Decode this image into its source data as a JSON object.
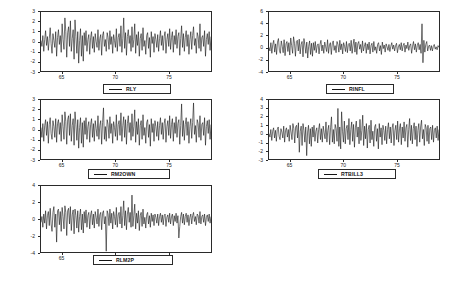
{
  "figure": {
    "width": 460,
    "height": 281,
    "background": "#ffffff",
    "line_color": "#141414",
    "axis_color": "#2a2a2a"
  },
  "chart_data": [
    {
      "type": "line",
      "title": "",
      "xlabel": "",
      "ylabel": "",
      "legend": "RLY",
      "legend_position": "below-center",
      "grid": false,
      "xlim": [
        63.0,
        79.0
      ],
      "ylim": [
        -3,
        3
      ],
      "xticks": [
        65,
        70,
        75
      ],
      "xtick_labels": [
        "65",
        "70",
        "75"
      ],
      "yticks": [
        3,
        2,
        1,
        0,
        -1,
        -2,
        -3
      ],
      "ytick_labels": [
        "3",
        "2",
        "1",
        "0",
        "-1",
        "-2",
        "-3"
      ],
      "values": [
        0.1,
        -0.5,
        0.6,
        -1.0,
        0.2,
        1.1,
        -0.4,
        0.5,
        -0.9,
        0.3,
        1.4,
        -0.2,
        -1.2,
        0.8,
        0.1,
        -0.6,
        1.0,
        -1.5,
        0.4,
        1.2,
        -0.3,
        0.6,
        -1.1,
        1.8,
        0.2,
        -0.8,
        2.4,
        1.0,
        -1.6,
        0.9,
        1.5,
        -0.5,
        2.1,
        -1.0,
        0.3,
        1.2,
        -1.8,
        2.2,
        0.5,
        -1.2,
        1.0,
        -2.2,
        0.1,
        1.3,
        -1.5,
        0.6,
        -2.0,
        0.9,
        -0.4,
        1.1,
        -1.0,
        0.2,
        0.7,
        -1.3,
        0.4,
        1.0,
        -0.7,
        0.5,
        -1.1,
        0.8,
        0.0,
        -0.6,
        1.2,
        -0.9,
        0.3,
        0.7,
        -1.4,
        0.6,
        1.0,
        -0.5,
        0.2,
        -1.0,
        0.9,
        0.4,
        -0.8,
        1.1,
        -0.3,
        0.5,
        -1.2,
        0.7,
        0.1,
        -0.6,
        1.3,
        -1.0,
        0.4,
        0.8,
        -0.5,
        1.6,
        -1.1,
        0.3,
        2.4,
        -0.7,
        0.9,
        -1.4,
        0.5,
        1.2,
        -0.2,
        0.6,
        -1.0,
        1.5,
        -0.6,
        0.2,
        1.8,
        -1.2,
        0.7,
        -0.4,
        1.0,
        -1.5,
        0.3,
        0.8,
        -0.9,
        1.4,
        -0.5,
        0.1,
        -1.3,
        0.6,
        0.9,
        -0.7,
        0.4,
        -1.6,
        1.0,
        -0.2,
        0.5,
        -1.1,
        0.8,
        0.2,
        -0.6,
        0.7,
        -1.0,
        0.3,
        1.1,
        -0.4,
        0.6,
        -0.9,
        0.5,
        1.0,
        -1.2,
        0.2,
        0.8,
        -0.5,
        1.3,
        -0.8,
        0.4,
        1.0,
        -1.1,
        0.6,
        -0.3,
        1.2,
        -0.7,
        0.5,
        0.9,
        -1.4,
        0.3,
        1.6,
        -0.6,
        0.8,
        -1.0,
        0.4,
        1.1,
        -0.5,
        0.7,
        -1.3,
        0.2,
        1.0,
        -0.8,
        0.6,
        1.5,
        -0.4,
        0.3,
        -1.2,
        0.9,
        0.5,
        -0.7,
        1.8,
        -1.0,
        0.4,
        0.6,
        -0.5,
        1.1,
        -1.5,
        0.2,
        0.8,
        -0.3,
        1.0,
        -0.9,
        0.5
      ]
    },
    {
      "type": "line",
      "title": "",
      "xlabel": "",
      "ylabel": "",
      "legend": "RINFL",
      "legend_position": "below-center",
      "grid": false,
      "xlim": [
        63.0,
        79.0
      ],
      "ylim": [
        -4,
        6
      ],
      "xticks": [
        65,
        70,
        75
      ],
      "xtick_labels": [
        "65",
        "70",
        "75"
      ],
      "yticks": [
        6,
        4,
        2,
        0,
        -2,
        -4
      ],
      "ytick_labels": [
        "6",
        "4",
        "2",
        "0",
        "-2",
        "-4"
      ],
      "values": [
        0.0,
        -0.6,
        0.8,
        -1.0,
        0.5,
        1.2,
        -0.8,
        0.6,
        -1.2,
        0.9,
        1.5,
        -0.5,
        -1.0,
        1.1,
        0.2,
        -0.9,
        1.3,
        -1.4,
        0.6,
        1.0,
        -0.7,
        0.8,
        -1.3,
        1.6,
        0.3,
        -1.0,
        1.8,
        0.7,
        -1.5,
        1.0,
        1.2,
        -0.6,
        1.4,
        -1.1,
        0.5,
        1.0,
        -1.6,
        1.5,
        0.4,
        -1.0,
        0.9,
        -1.8,
        0.2,
        1.1,
        -1.2,
        0.7,
        -1.5,
        0.8,
        -0.5,
        1.0,
        -0.9,
        0.3,
        0.6,
        -1.1,
        0.5,
        1.2,
        -0.6,
        0.4,
        -1.0,
        0.9,
        0.1,
        -0.7,
        1.3,
        -1.0,
        0.4,
        0.8,
        -1.2,
        0.6,
        1.1,
        -0.5,
        0.3,
        -0.9,
        1.0,
        0.5,
        -0.8,
        1.2,
        -0.4,
        0.6,
        -1.1,
        0.8,
        0.2,
        -0.7,
        1.0,
        -0.9,
        0.5,
        0.7,
        -0.6,
        1.2,
        -1.0,
        0.4,
        1.4,
        -0.8,
        0.9,
        -1.2,
        0.6,
        1.0,
        -0.3,
        0.5,
        -0.9,
        1.1,
        -0.6,
        0.2,
        0.8,
        -1.0,
        0.6,
        -0.4,
        0.9,
        -1.1,
        0.3,
        0.7,
        -0.8,
        1.0,
        -0.5,
        0.1,
        -1.0,
        0.5,
        0.8,
        -0.6,
        0.3,
        -1.2,
        0.9,
        -0.2,
        0.4,
        -0.8,
        0.6,
        0.1,
        -0.5,
        0.5,
        -0.7,
        0.2,
        0.8,
        -0.3,
        0.4,
        -0.6,
        0.3,
        0.7,
        -0.9,
        0.1,
        0.5,
        -0.4,
        0.8,
        -0.6,
        0.3,
        0.7,
        -0.8,
        0.4,
        -0.2,
        0.9,
        -0.5,
        0.3,
        0.6,
        -1.0,
        0.2,
        1.0,
        -0.4,
        0.6,
        -0.8,
        0.3,
        0.8,
        -0.4,
        0.5,
        -1.0,
        4.0,
        -2.6,
        1.2,
        -0.8,
        0.5,
        1.0,
        -0.6,
        0.2,
        0.4,
        -0.5,
        0.3,
        -0.6,
        0.2,
        0.5,
        -0.3,
        0.1,
        -0.4,
        0.3,
        0.0
      ]
    },
    {
      "type": "line",
      "title": "",
      "xlabel": "",
      "ylabel": "",
      "legend": "RM2OWN",
      "legend_position": "below-center",
      "grid": false,
      "xlim": [
        63.0,
        79.0
      ],
      "ylim": [
        -3,
        3
      ],
      "xticks": [
        65,
        70,
        75
      ],
      "xtick_labels": [
        "65",
        "70",
        "75"
      ],
      "yticks": [
        3,
        2,
        1,
        0,
        -1,
        -2,
        -3
      ],
      "ytick_labels": [
        "3",
        "2",
        "1",
        "0",
        "-1",
        "-2",
        "-3"
      ],
      "values": [
        0.2,
        -0.8,
        0.6,
        -1.2,
        0.4,
        1.0,
        -0.6,
        0.8,
        -1.4,
        0.5,
        1.2,
        -0.4,
        -1.0,
        0.9,
        0.3,
        -0.8,
        1.1,
        -1.3,
        0.6,
        1.0,
        -0.5,
        0.7,
        -1.2,
        1.5,
        0.3,
        -1.0,
        1.8,
        0.8,
        -1.5,
        1.0,
        1.4,
        -0.6,
        1.6,
        -1.2,
        0.4,
        1.1,
        -1.6,
        1.8,
        0.5,
        -1.1,
        1.0,
        -1.9,
        0.2,
        1.2,
        -1.4,
        0.7,
        -1.8,
        0.9,
        -0.5,
        1.2,
        -1.0,
        0.3,
        0.8,
        -1.3,
        0.5,
        1.1,
        -0.8,
        0.6,
        -1.2,
        0.9,
        0.1,
        -0.7,
        1.4,
        -1.0,
        0.4,
        0.9,
        -1.5,
        0.7,
        2.2,
        -1.0,
        0.3,
        -1.2,
        1.0,
        0.5,
        -0.9,
        1.3,
        -0.4,
        0.6,
        -1.4,
        0.8,
        0.2,
        -0.7,
        1.5,
        -1.1,
        0.5,
        0.9,
        -0.6,
        1.7,
        -1.2,
        0.4,
        1.3,
        -0.8,
        1.0,
        -1.5,
        0.6,
        1.4,
        -0.3,
        0.7,
        -1.1,
        1.6,
        -0.7,
        0.3,
        2.0,
        -1.3,
        0.8,
        -0.5,
        1.1,
        -1.6,
        0.4,
        0.9,
        -1.0,
        1.5,
        -0.6,
        0.2,
        -1.4,
        0.7,
        1.0,
        -0.8,
        0.5,
        -1.7,
        1.1,
        -0.3,
        0.6,
        -1.2,
        0.9,
        0.3,
        -0.7,
        0.8,
        -1.1,
        0.4,
        1.2,
        -0.5,
        0.7,
        -1.0,
        0.6,
        1.1,
        -1.3,
        0.3,
        0.9,
        -0.6,
        1.4,
        -0.9,
        0.5,
        1.1,
        -1.2,
        0.7,
        -0.4,
        1.3,
        -0.8,
        0.6,
        1.0,
        -1.5,
        0.4,
        2.6,
        -0.7,
        0.9,
        -1.1,
        0.5,
        1.2,
        -0.6,
        0.8,
        -1.4,
        0.3,
        1.1,
        -0.9,
        0.7,
        2.7,
        -0.5,
        0.4,
        -1.3,
        1.0,
        0.6,
        -0.8,
        1.4,
        -1.1,
        0.5,
        0.7,
        -0.6,
        1.2,
        -1.6,
        0.3,
        0.9,
        -0.4,
        1.0,
        -1.0,
        0.5
      ]
    },
    {
      "type": "line",
      "title": "",
      "xlabel": "",
      "ylabel": "",
      "legend": "RTBILL3",
      "legend_position": "below-center",
      "grid": false,
      "xlim": [
        63.0,
        79.0
      ],
      "ylim": [
        -3,
        4
      ],
      "xticks": [
        65,
        70,
        75
      ],
      "xtick_labels": [
        "65",
        "70",
        "75"
      ],
      "yticks": [
        4,
        3,
        2,
        1,
        0,
        -1,
        -2,
        -3
      ],
      "ytick_labels": [
        "4",
        "3",
        "2",
        "1",
        "0",
        "-1",
        "-2",
        "-3"
      ],
      "values": [
        0.0,
        -0.4,
        0.5,
        -0.8,
        0.3,
        0.7,
        -0.5,
        0.4,
        -0.9,
        0.5,
        0.8,
        -0.3,
        -0.7,
        0.6,
        0.2,
        -0.5,
        0.9,
        -1.0,
        0.4,
        0.7,
        -0.4,
        0.5,
        -0.9,
        1.0,
        0.2,
        -0.7,
        1.2,
        0.6,
        -1.1,
        0.8,
        1.0,
        -0.5,
        1.3,
        -2.2,
        0.3,
        0.9,
        -1.4,
        1.2,
        0.4,
        -1.0,
        0.8,
        -2.6,
        0.2,
        1.0,
        -1.2,
        0.6,
        -1.5,
        0.8,
        -0.4,
        1.0,
        -0.9,
        0.3,
        0.7,
        -1.1,
        0.5,
        1.2,
        -0.7,
        0.6,
        -1.0,
        0.9,
        0.1,
        -0.6,
        1.4,
        -1.0,
        0.4,
        1.0,
        -1.3,
        0.7,
        2.0,
        -1.0,
        0.5,
        -1.2,
        1.1,
        0.6,
        -0.9,
        3.0,
        -1.5,
        0.8,
        -1.8,
        2.6,
        0.3,
        -1.0,
        1.5,
        -1.2,
        0.6,
        1.0,
        -0.7,
        1.8,
        -1.3,
        0.5,
        1.4,
        -0.9,
        1.1,
        -1.6,
        0.7,
        1.5,
        -0.4,
        0.8,
        -1.2,
        1.7,
        -0.8,
        0.4,
        2.2,
        -1.4,
        0.9,
        -0.6,
        1.2,
        -1.7,
        0.5,
        1.0,
        -1.1,
        1.6,
        -0.7,
        0.3,
        -1.5,
        0.8,
        1.1,
        -0.9,
        0.6,
        -1.8,
        1.2,
        -0.4,
        0.7,
        -1.3,
        1.0,
        0.4,
        -0.8,
        0.9,
        -1.2,
        0.5,
        1.3,
        -0.6,
        0.8,
        -1.1,
        0.7,
        1.2,
        -1.4,
        0.4,
        1.0,
        -0.7,
        1.5,
        -1.0,
        0.6,
        1.2,
        -1.3,
        0.8,
        -0.5,
        1.4,
        -0.9,
        0.7,
        1.1,
        -1.6,
        0.5,
        1.8,
        -0.8,
        1.0,
        -1.2,
        0.6,
        1.3,
        -0.7,
        0.9,
        -1.5,
        0.4,
        1.2,
        -1.0,
        0.8,
        1.6,
        -0.6,
        0.5,
        -1.4,
        1.1,
        0.7,
        -0.9,
        1.0,
        -1.2,
        0.6,
        0.8,
        -0.7,
        1.0,
        -1.0,
        0.4,
        0.7,
        -0.5,
        0.9,
        -0.8,
        0.5
      ]
    },
    {
      "type": "line",
      "title": "",
      "xlabel": "",
      "ylabel": "",
      "legend": "RLM2P",
      "legend_position": "below-center",
      "grid": false,
      "xlim": [
        63.0,
        79.0
      ],
      "ylim": [
        -4,
        4
      ],
      "xticks": [
        65,
        70,
        75
      ],
      "xtick_labels": [
        "65",
        "70",
        "75"
      ],
      "yticks": [
        4,
        2,
        0,
        -2,
        -4
      ],
      "ytick_labels": [
        "4",
        "2",
        "0",
        "-2",
        "-4"
      ],
      "values": [
        -0.4,
        0.3,
        -1.0,
        0.6,
        -0.5,
        1.0,
        -1.2,
        0.4,
        0.9,
        -0.8,
        1.3,
        -0.6,
        -1.5,
        0.8,
        1.5,
        -1.0,
        0.6,
        -2.8,
        1.0,
        1.2,
        -0.7,
        0.9,
        -1.5,
        1.4,
        0.3,
        -1.2,
        1.6,
        0.8,
        -2.0,
        1.0,
        1.3,
        -0.6,
        1.5,
        -1.4,
        0.5,
        1.1,
        -1.8,
        1.2,
        0.4,
        -1.1,
        1.0,
        -1.6,
        0.3,
        1.2,
        -1.3,
        0.6,
        -1.7,
        0.9,
        -0.5,
        1.1,
        -1.0,
        0.4,
        0.8,
        -1.2,
        0.5,
        1.0,
        -0.7,
        0.6,
        -1.1,
        0.9,
        0.2,
        -0.6,
        1.2,
        -0.9,
        0.5,
        0.8,
        -1.3,
        0.7,
        1.0,
        -0.6,
        0.3,
        -3.9,
        1.0,
        0.6,
        -0.8,
        1.2,
        -0.5,
        0.7,
        -1.2,
        0.9,
        0.3,
        -0.7,
        1.4,
        -1.0,
        0.5,
        0.8,
        -0.6,
        1.5,
        -1.1,
        0.4,
        2.2,
        -0.8,
        1.0,
        -1.3,
        0.6,
        1.4,
        -0.4,
        0.8,
        -1.0,
        2.9,
        -0.9,
        0.4,
        1.8,
        -1.2,
        0.7,
        -0.5,
        1.0,
        -1.4,
        0.4,
        0.8,
        -0.9,
        1.2,
        -0.6,
        0.2,
        -1.1,
        0.5,
        0.8,
        -0.6,
        0.4,
        -1.0,
        0.7,
        -0.3,
        0.5,
        -0.8,
        0.6,
        0.2,
        -0.5,
        0.6,
        -0.8,
        0.3,
        0.7,
        -0.4,
        0.5,
        -0.7,
        0.4,
        0.6,
        -0.9,
        0.2,
        0.5,
        -0.4,
        0.7,
        -0.6,
        0.3,
        0.6,
        -0.8,
        0.4,
        -0.3,
        0.7,
        -0.5,
        0.4,
        -2.3,
        -0.9,
        0.3,
        0.8,
        -0.5,
        0.6,
        -0.7,
        0.3,
        0.7,
        -0.4,
        0.5,
        -0.8,
        0.2,
        0.6,
        -0.6,
        0.4,
        0.8,
        -0.3,
        0.3,
        -0.7,
        0.6,
        0.4,
        -0.5,
        0.9,
        -0.6,
        0.3,
        0.5,
        -0.4,
        0.6,
        -0.8,
        0.2,
        0.5,
        -0.3,
        0.6,
        -0.5,
        0.3
      ]
    }
  ]
}
